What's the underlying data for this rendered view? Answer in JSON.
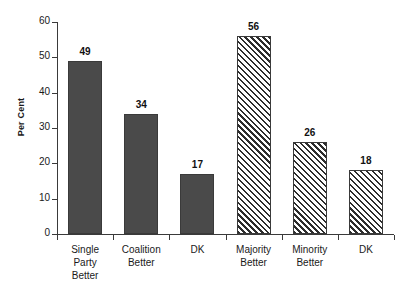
{
  "chart_data": {
    "type": "bar",
    "title": "",
    "subtitle": "",
    "xlabel": "",
    "ylabel": "Per Cent",
    "ylim": [
      0,
      60
    ],
    "yticks": [
      0,
      10,
      20,
      30,
      40,
      50,
      60
    ],
    "ytick_labels": [
      "0",
      "10",
      "20",
      "30",
      "40",
      "50",
      "60"
    ],
    "grid": false,
    "legend": null,
    "categories": [
      "Single Party Better",
      "Coalition Better",
      "DK",
      "Majority Better",
      "Minority Better",
      "DK"
    ],
    "category_lines": [
      [
        "Single",
        "Party",
        "Better"
      ],
      [
        "Coalition",
        "Better"
      ],
      [
        "DK"
      ],
      [
        "Majority",
        "Better"
      ],
      [
        "Minority",
        "Better"
      ],
      [
        "DK"
      ]
    ],
    "values": [
      49,
      34,
      17,
      56,
      26,
      18
    ],
    "value_labels": [
      "49",
      "34",
      "17",
      "56",
      "26",
      "18"
    ],
    "bar_styles": [
      "solid",
      "solid",
      "solid",
      "hatch",
      "hatch",
      "hatch"
    ],
    "colors": {
      "solid_fill": "#4a4a4a",
      "hatch_line": "#2d2d2d",
      "hatch_background": "#ffffff",
      "bar_border": "#3a3a3a",
      "axis": "#3a3a3a",
      "text": "#1a1a1a",
      "background": "#ffffff"
    }
  }
}
